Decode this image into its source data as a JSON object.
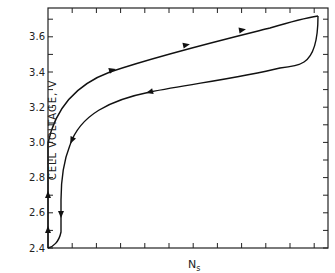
{
  "chart_data": {
    "type": "line",
    "title": "",
    "xlabel": "N",
    "xlabel_sub": "s",
    "ylabel": "CELL  VOLTAGE, V",
    "ylim": [
      2.4,
      3.78
    ],
    "yticks": [
      "2.4",
      "2.6",
      "2.8",
      "3.0",
      "3.2",
      "3.4",
      "3.6"
    ],
    "xticks_labeled": false,
    "grid": false,
    "series": [
      {
        "name": "charge",
        "direction": "up/right",
        "points": [
          [
            0,
            2.4
          ],
          [
            0,
            3.0
          ],
          [
            0.1,
            3.2
          ],
          [
            0.25,
            3.35
          ],
          [
            0.4,
            3.45
          ],
          [
            0.6,
            3.55
          ],
          [
            0.8,
            3.64
          ],
          [
            0.96,
            3.7
          ]
        ]
      },
      {
        "name": "discharge",
        "direction": "down/left",
        "points": [
          [
            0.96,
            3.7
          ],
          [
            0.95,
            3.55
          ],
          [
            0.9,
            3.47
          ],
          [
            0.7,
            3.38
          ],
          [
            0.4,
            3.28
          ],
          [
            0.2,
            3.18
          ],
          [
            0.08,
            3.0
          ],
          [
            0.05,
            2.85
          ],
          [
            0.05,
            2.55
          ],
          [
            0,
            2.4
          ]
        ]
      }
    ]
  }
}
